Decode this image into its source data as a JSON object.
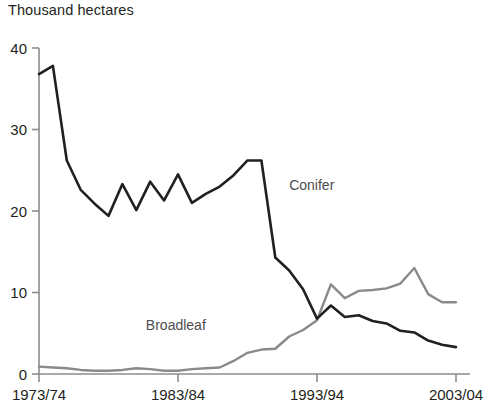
{
  "chart_data": {
    "type": "line",
    "title": "Thousand hectares",
    "ylabel": "Thousand hectares",
    "xlabel": "",
    "grid": false,
    "legend_position": "inline-labels",
    "ylim": [
      0,
      40
    ],
    "yticks": [
      0,
      10,
      20,
      30,
      40
    ],
    "ytick_labels": [
      "0",
      "10",
      "20",
      "30",
      "40"
    ],
    "xticks": [
      "1973/74",
      "1983/84",
      "1993/94",
      "2003/04"
    ],
    "x": [
      "1973/74",
      "1974/75",
      "1975/76",
      "1976/77",
      "1977/78",
      "1978/79",
      "1979/80",
      "1980/81",
      "1981/82",
      "1982/83",
      "1983/84",
      "1984/85",
      "1985/86",
      "1986/87",
      "1987/88",
      "1988/89",
      "1989/90",
      "1990/91",
      "1991/92",
      "1992/93",
      "1993/94",
      "1994/95",
      "1995/96",
      "1996/97",
      "1997/98",
      "1998/99",
      "1999/00",
      "2000/01",
      "2001/02",
      "2002/03",
      "2003/04"
    ],
    "series": [
      {
        "name": "Conifer",
        "color": "#231f20",
        "values": [
          36.8,
          37.8,
          26.2,
          22.6,
          20.9,
          19.4,
          23.3,
          20.1,
          23.6,
          21.3,
          24.5,
          21.0,
          22.1,
          23.0,
          24.4,
          26.2,
          26.2,
          14.3,
          12.7,
          10.4,
          6.8,
          8.4,
          7.0,
          7.2,
          6.5,
          6.2,
          5.3,
          5.1,
          4.1,
          3.6,
          3.3
        ]
      },
      {
        "name": "Broadleaf",
        "color": "#8a8a8a",
        "values": [
          0.9,
          0.8,
          0.7,
          0.5,
          0.4,
          0.4,
          0.5,
          0.7,
          0.6,
          0.4,
          0.4,
          0.6,
          0.7,
          0.8,
          1.6,
          2.6,
          3.0,
          3.1,
          4.6,
          5.4,
          6.6,
          11.0,
          9.3,
          10.2,
          10.3,
          10.5,
          11.1,
          13.0,
          9.8,
          8.8,
          8.8
        ]
      }
    ],
    "annotations": [
      {
        "text": "Conifer",
        "x_index": 18,
        "y_value": 22.6
      },
      {
        "text": "Broadleaf",
        "x_index": 12,
        "y_value": 5.4
      }
    ]
  },
  "axis_title": "Thousand hectares"
}
